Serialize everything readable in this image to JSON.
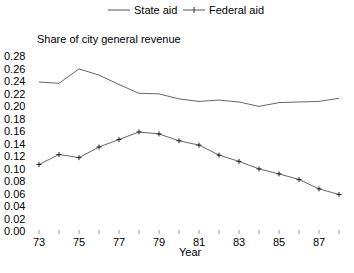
{
  "chart_data": {
    "type": "line",
    "title": "",
    "ylabel": "Share of city general revenue",
    "xlabel": "Year",
    "x": [
      73,
      74,
      75,
      76,
      77,
      78,
      79,
      80,
      81,
      82,
      83,
      84,
      85,
      86,
      87,
      88
    ],
    "xticks": [
      "73",
      "75",
      "77",
      "79",
      "81",
      "83",
      "85",
      "87"
    ],
    "yticks": [
      "0.28",
      "0.26",
      "0.24",
      "0.22",
      "0.20",
      "0.18",
      "0.16",
      "0.14",
      "0.12",
      "0.10",
      "0.08",
      "0.06",
      "0.04",
      "0.02",
      "0.00"
    ],
    "ylim": [
      0,
      0.28
    ],
    "grid": false,
    "legend_position": "top",
    "series": [
      {
        "name": "State aid",
        "marker": "none",
        "values": [
          0.24,
          0.238,
          0.261,
          0.251,
          0.236,
          0.222,
          0.221,
          0.213,
          0.209,
          0.211,
          0.208,
          0.201,
          0.207,
          0.208,
          0.209,
          0.214
        ]
      },
      {
        "name": "Federal aid",
        "marker": "plus",
        "values": [
          0.108,
          0.124,
          0.119,
          0.136,
          0.148,
          0.16,
          0.157,
          0.146,
          0.139,
          0.123,
          0.113,
          0.101,
          0.093,
          0.084,
          0.069,
          0.06
        ]
      }
    ]
  },
  "legend": {
    "state": "State aid",
    "federal": "Federal aid"
  }
}
